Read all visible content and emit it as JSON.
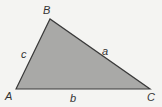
{
  "diagram": {
    "type": "triangle",
    "fill_color": "#a9a9a7",
    "stroke_color": "#3a3a3a",
    "background_color": "#f4f4f2",
    "vertices": {
      "A": {
        "label": "A",
        "x": 16,
        "y": 89
      },
      "B": {
        "label": "B",
        "x": 50,
        "y": 19
      },
      "C": {
        "label": "C",
        "x": 150,
        "y": 89
      }
    },
    "sides": {
      "a": {
        "label": "a",
        "between": [
          "B",
          "C"
        ]
      },
      "b": {
        "label": "b",
        "between": [
          "A",
          "C"
        ]
      },
      "c": {
        "label": "c",
        "between": [
          "A",
          "B"
        ]
      }
    }
  }
}
